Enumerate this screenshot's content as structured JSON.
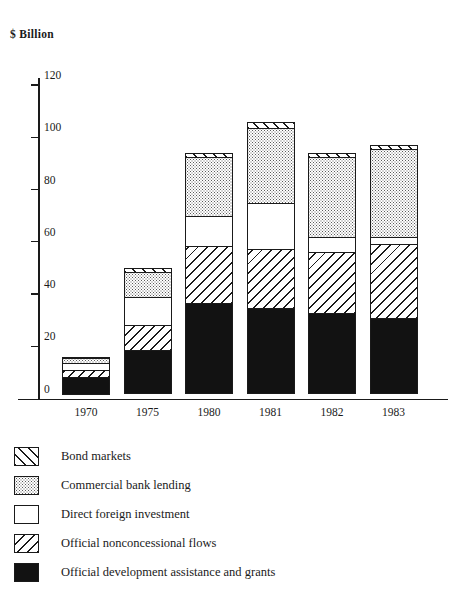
{
  "chart_data": {
    "type": "bar",
    "title": "$ Billion",
    "subtitle": "",
    "xlabel": "",
    "ylabel": "$ Billion",
    "stacked": true,
    "grid": false,
    "legend_position": "bottom-left",
    "ylim": [
      0,
      120
    ],
    "yticks": [
      0,
      20,
      40,
      60,
      80,
      100,
      120
    ],
    "ytick_labels": [
      "0",
      "20",
      "40",
      "60",
      "80",
      "100",
      "120"
    ],
    "categories": [
      "1970",
      "1975",
      "1980",
      "1981",
      "1982",
      "1983"
    ],
    "series": [
      {
        "name": "Official development assistance and grants",
        "pattern": "solid-black",
        "values": [
          7,
          17,
          35,
          33,
          31,
          29
        ]
      },
      {
        "name": "Official nonconcessional flows",
        "pattern": "hatch-backslash",
        "values": [
          3,
          10,
          22,
          23,
          24,
          29
        ]
      },
      {
        "name": "Direct foreign investment",
        "pattern": "white",
        "values": [
          3,
          11,
          12,
          18,
          6,
          3
        ]
      },
      {
        "name": "Commercial bank lending",
        "pattern": "dotted-gray",
        "values": [
          2.5,
          10,
          23,
          29,
          31,
          34
        ]
      },
      {
        "name": "Bond markets",
        "pattern": "hatch-forwardslash",
        "values": [
          0.5,
          2,
          2,
          3,
          2,
          2
        ]
      }
    ],
    "totals": [
      16,
      50,
      94,
      106,
      94,
      97
    ]
  },
  "legend": {
    "items": [
      {
        "label": "Bond markets",
        "pattern": "hatch-forwardslash"
      },
      {
        "label": "Commercial bank lending",
        "pattern": "dotted-gray"
      },
      {
        "label": "Direct foreign investment",
        "pattern": "white"
      },
      {
        "label": "Official nonconcessional flows",
        "pattern": "hatch-backslash"
      },
      {
        "label": "Official development assistance and grants",
        "pattern": "solid-black"
      }
    ]
  },
  "colors": {
    "ink": "#1a1a1a",
    "background": "#ffffff",
    "dot_gray": "#5a5a5a"
  }
}
